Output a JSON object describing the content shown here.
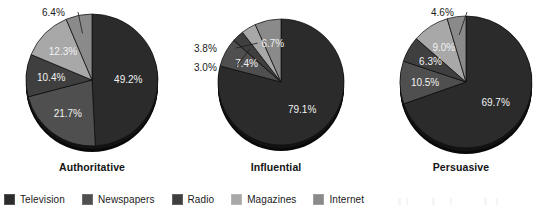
{
  "chart_data": {
    "type": "pie",
    "title": "",
    "multiple": true,
    "categories": [
      "Television",
      "Newspapers",
      "Radio",
      "Magazines",
      "Internet"
    ],
    "colors": [
      "#2b2b2b",
      "#4f4f4f",
      "#3f3f3f",
      "#a8a8a8",
      "#8a8a8a"
    ],
    "charts": [
      {
        "title": "Authoritative",
        "values": [
          49.2,
          21.7,
          10.4,
          12.3,
          6.4
        ],
        "labels": [
          "49.2%",
          "21.7%",
          "10.4%",
          "12.3%",
          "6.4%"
        ]
      },
      {
        "title": "Influential",
        "values": [
          79.1,
          7.4,
          3.0,
          3.8,
          6.7
        ],
        "labels": [
          "79.1%",
          "7.4%",
          "3.0%",
          "3.8%",
          "6.7%"
        ]
      },
      {
        "title": "Persuasive",
        "values": [
          69.7,
          10.5,
          6.3,
          9.0,
          4.6
        ],
        "labels": [
          "69.7%",
          "10.5%",
          "6.3%",
          "9.0%",
          "4.6%"
        ]
      }
    ],
    "legend_position": "bottom",
    "grid": false
  },
  "legend": {
    "items": [
      {
        "label": "Television",
        "color": "#2b2b2b"
      },
      {
        "label": "Newspapers",
        "color": "#4f4f4f"
      },
      {
        "label": "Radio",
        "color": "#3f3f3f"
      },
      {
        "label": "Magazines",
        "color": "#a8a8a8"
      },
      {
        "label": "Internet",
        "color": "#8a8a8a"
      }
    ]
  }
}
